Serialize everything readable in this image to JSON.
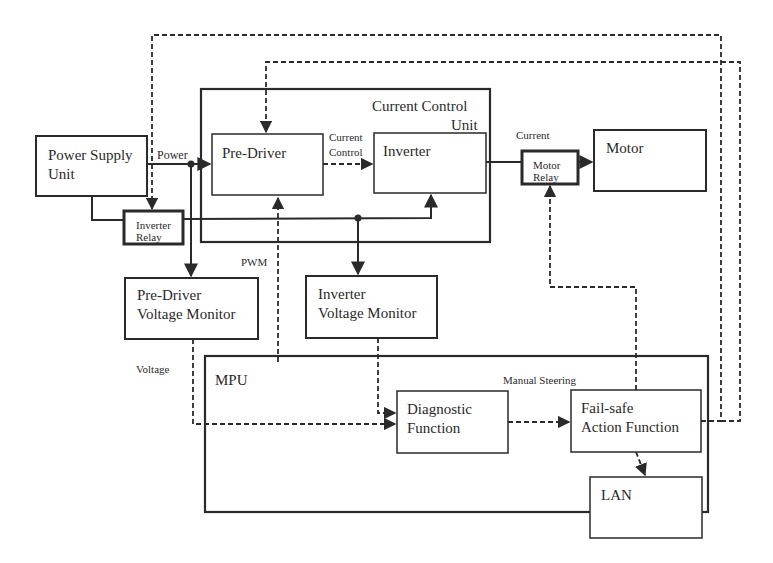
{
  "colors": {
    "stroke": "#2a2a2a",
    "background": "#ffffff"
  },
  "blocks": {
    "power_supply": {
      "line1": "Power Supply",
      "line2": "Unit"
    },
    "inverter_relay": {
      "line1": "Inverter",
      "line2": "Relay"
    },
    "current_control_unit": {
      "line1": "Current Control",
      "line2": "Unit"
    },
    "pre_driver": {
      "label": "Pre-Driver"
    },
    "inverter": {
      "label": "Inverter"
    },
    "motor_relay": {
      "line1": "Motor",
      "line2": "Relay"
    },
    "motor": {
      "label": "Motor"
    },
    "pre_driver_voltage_monitor": {
      "line1": "Pre-Driver",
      "line2": "Voltage Monitor"
    },
    "inverter_voltage_monitor": {
      "line1": "Inverter",
      "line2": "Voltage Monitor"
    },
    "mpu": {
      "label": "MPU"
    },
    "diagnostic_function": {
      "line1": "Diagnostic",
      "line2": "Function"
    },
    "failsafe_action_function": {
      "line1": "Fail-safe",
      "line2": "Action Function"
    },
    "lan": {
      "label": "LAN"
    }
  },
  "signal_labels": {
    "power": "Power",
    "current_control_1": "Current",
    "current_control_2": "Control",
    "current": "Current",
    "pwm": "PWM",
    "voltage": "Voltage",
    "manual_steering": "Manual Steering"
  }
}
